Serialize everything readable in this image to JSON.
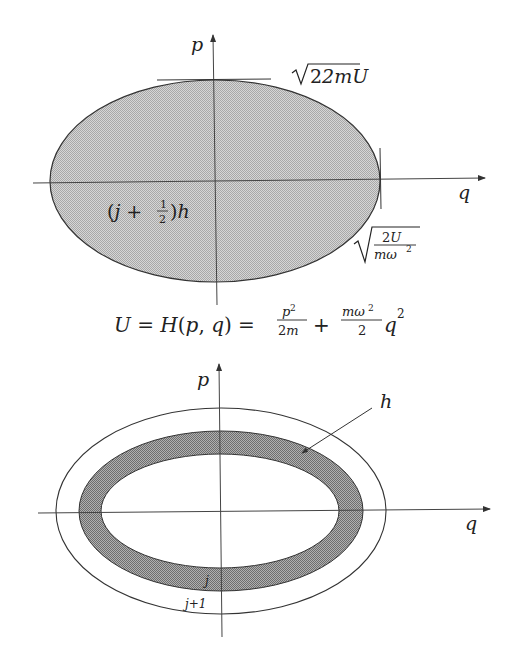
{
  "diagram_top": {
    "axis_p_label": "p",
    "axis_q_label": "q",
    "top_tick_label": "2mU",
    "right_tick_label_num": "2U",
    "right_tick_label_den": "mω",
    "right_tick_label_den_exp": "2",
    "area_label_prefix": "(j + ",
    "area_label_frac_num": "1",
    "area_label_frac_den": "2",
    "area_label_suffix": ")h",
    "fill_color": "#c4c4c4",
    "stroke_color": "#333333"
  },
  "equation": {
    "lhs": "U = H(p, q) = ",
    "frac1_num": "p",
    "frac1_num_exp": "2",
    "frac1_den": "2m",
    "plus": "+",
    "frac2_num": "mω",
    "frac2_num_exp": "2",
    "frac2_den": "2",
    "tail": "q",
    "tail_exp": "2"
  },
  "diagram_bottom": {
    "axis_p_label": "p",
    "axis_q_label": "q",
    "band_label": "h",
    "inner_label": "j",
    "outer_label": "j+1",
    "band_color": "#9a9a9a",
    "stroke_color": "#333333"
  }
}
